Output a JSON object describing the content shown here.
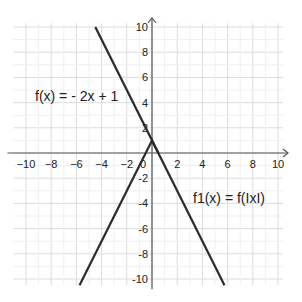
{
  "chart_data": {
    "type": "line",
    "title": "",
    "xlabel": "",
    "ylabel": "",
    "xlim": [
      -11,
      11
    ],
    "ylim": [
      -10.5,
      10.5
    ],
    "grid": true,
    "x_ticks": [
      -10,
      -8,
      -6,
      -4,
      -2,
      0,
      2,
      4,
      6,
      8,
      10
    ],
    "y_ticks": [
      -10,
      -8,
      -6,
      -4,
      -2,
      2,
      4,
      6,
      8,
      10
    ],
    "series": [
      {
        "name": "f(x) = - 2x + 1",
        "equation": "-2x+1",
        "x": [
          -4.5,
          0.5
        ],
        "y": [
          10,
          0
        ],
        "note": "visible upper-left portion of f"
      },
      {
        "name": "f1(x) = f(|x|)",
        "equation": "-2|x|+1",
        "x": [
          -5.75,
          0,
          5.75
        ],
        "y": [
          -10.5,
          1,
          -10.5
        ]
      }
    ],
    "annotations": [
      {
        "text": "f(x) = - 2x + 1",
        "x": -9.5,
        "y": 3.5
      },
      {
        "text": "f1(x) = f(IxI)",
        "x": 3.2,
        "y": -3.5
      }
    ]
  },
  "labels": {
    "f": "f(x) = - 2x + 1",
    "f1": "f1(x) = f(IxI)",
    "origin": "0"
  },
  "colors": {
    "grid": "#dcdcdc",
    "axis": "#555555",
    "curve": "#2b2b2b"
  }
}
